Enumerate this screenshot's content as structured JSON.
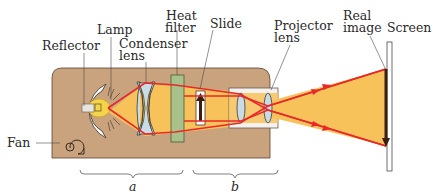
{
  "diagram": {
    "labels": {
      "reflector": "Reflector",
      "lamp": "Lamp",
      "condenser_line1": "Condenser",
      "condenser_line2": "lens",
      "heat_line1": "Heat",
      "heat_line2": "filter",
      "slide": "Slide",
      "projector_line1": "Projector",
      "projector_line2": "lens",
      "real_line1": "Real",
      "real_line2": "image",
      "screen": "Screen",
      "fan": "Fan",
      "brace_a": "a",
      "brace_b": "b"
    },
    "colors": {
      "body": "#c9a27e",
      "body_stroke": "#5a4030",
      "beam": "#f7c25a",
      "ray": "#e8282a",
      "lens": "#c9dbe4",
      "heat_filter": "#a8c08a",
      "arrow": "#3a1f10",
      "lamp_glow": "#f4d44a"
    }
  }
}
